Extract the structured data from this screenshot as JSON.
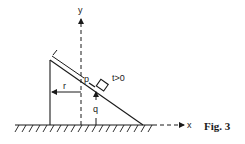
{
  "figure": {
    "caption": "Fig. 3",
    "labels": {
      "y_axis": "y",
      "x_axis": "x",
      "point": "p",
      "time_condition": "t>0",
      "horizontal_distance": "r",
      "vertical_height": "q"
    }
  },
  "colors": {
    "ink": "#1a1a1a",
    "background": "#ffffff"
  }
}
